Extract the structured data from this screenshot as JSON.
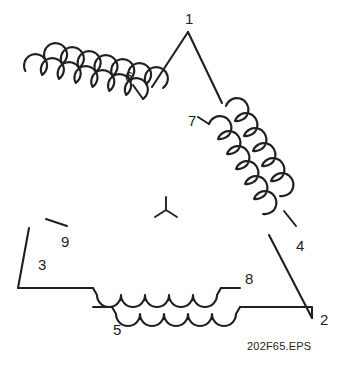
{
  "figure": {
    "type": "delta-connected-winding-diagram",
    "caption": "202F65.EPS",
    "center_symbol": "wye-symbol"
  },
  "terminals": [
    {
      "id": "t1",
      "label": "1",
      "role": "triangle-apex-vertex",
      "x": 185,
      "y": 11
    },
    {
      "id": "t2",
      "label": "2",
      "role": "triangle-bottom-right-vertex",
      "x": 320,
      "y": 312
    },
    {
      "id": "t3",
      "label": "3",
      "role": "triangle-bottom-left-vertex",
      "x": 38,
      "y": 257
    },
    {
      "id": "t4",
      "label": "4",
      "role": "right-leg-outer-coil-lead",
      "x": 296,
      "y": 238
    },
    {
      "id": "t5",
      "label": "5",
      "role": "bottom-lower-coil-lead",
      "x": 113,
      "y": 322
    },
    {
      "id": "t6",
      "label": "6",
      "role": "left-leg-outer-coil-lead",
      "x": 125,
      "y": 69
    },
    {
      "id": "t7",
      "label": "7",
      "role": "right-leg-inner-coil-lead",
      "x": 188,
      "y": 113
    },
    {
      "id": "t8",
      "label": "8",
      "role": "bottom-upper-coil-lead",
      "x": 245,
      "y": 271
    },
    {
      "id": "t9",
      "label": "9",
      "role": "left-leg-inner-coil-lead",
      "x": 61,
      "y": 234
    }
  ],
  "geometry": {
    "vertex_apex": {
      "x": 188,
      "y": 32
    },
    "vertex_bottom_left": {
      "x": 18,
      "y": 288
    },
    "vertex_bottom_right": {
      "x": 312,
      "y": 318
    },
    "coils_per_leg": 2,
    "stroke_color": "#231f20",
    "background_color": "#ffffff"
  }
}
